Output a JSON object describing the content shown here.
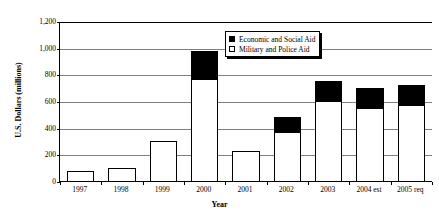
{
  "chart_data": {
    "type": "bar",
    "title": "",
    "subtitle": "",
    "xlabel": "Year",
    "ylabel": "U.S. Dollars (millions)",
    "ylim": [
      0,
      1200
    ],
    "ytick_step": 200,
    "ytick_labels": [
      "1,200",
      "1,000",
      "800",
      "600",
      "400",
      "200",
      "0"
    ],
    "ytick_values": [
      1200,
      1000,
      800,
      600,
      400,
      200,
      0
    ],
    "grid": true,
    "grid_axis": "y",
    "stacked": true,
    "legend_position": "top-center-right",
    "categories": [
      "1997",
      "1998",
      "1999",
      "2000",
      "2001",
      "2002",
      "2003",
      "2004 est",
      "2005 req"
    ],
    "series": [
      {
        "name": "Military and Police Aid",
        "color": "#ffffff",
        "edge_color": "#000000",
        "values": [
          80,
          105,
          310,
          770,
          230,
          375,
          610,
          555,
          580
        ]
      },
      {
        "name": "Economic and Social Aid",
        "color": "#000000",
        "edge_color": "#000000",
        "values": [
          0,
          0,
          0,
          210,
          0,
          110,
          145,
          150,
          150
        ]
      }
    ],
    "totals": [
      80,
      105,
      310,
      980,
      230,
      485,
      755,
      705,
      730
    ],
    "annotations": []
  },
  "legend": {
    "entries": [
      {
        "label": "Economic and Social Aid",
        "swatch": "black-filled-square"
      },
      {
        "label": "Military and Police Aid",
        "swatch": "white-outlined-square"
      }
    ]
  },
  "colors": {
    "economic_aid": "#000000",
    "military_aid": "#ffffff",
    "axis": "#000000",
    "gridline": "#808080",
    "background": "#ffffff"
  }
}
